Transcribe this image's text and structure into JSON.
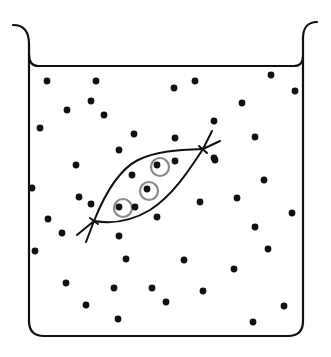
{
  "diagram": {
    "title": "Dialysis bag in beaker (diffusion / osmosis)",
    "colors": {
      "outline": "#111111",
      "particle": "#111111",
      "large_molecule_ring": "#8a8a8a",
      "background": "#ffffff"
    },
    "beaker": {
      "left_wall_x": 29,
      "right_wall_x": 303,
      "bottom_y": 336,
      "water_line_y": 66,
      "corner_radius": 15
    },
    "bag": {
      "knot_bottom_left": [
        94,
        221
      ],
      "knot_top_right": [
        203,
        149
      ],
      "large_molecules": [
        {
          "cx": 160,
          "cy": 167,
          "r": 9
        },
        {
          "cx": 149,
          "cy": 191,
          "r": 9
        },
        {
          "cx": 123,
          "cy": 208,
          "r": 9
        }
      ]
    },
    "particles": [
      [
        47,
        81
      ],
      [
        96,
        81
      ],
      [
        91,
        101
      ],
      [
        67,
        110
      ],
      [
        104,
        115
      ],
      [
        40,
        128
      ],
      [
        134,
        134
      ],
      [
        119,
        150
      ],
      [
        174,
        88
      ],
      [
        195,
        81
      ],
      [
        271,
        75
      ],
      [
        295,
        91
      ],
      [
        242,
        103
      ],
      [
        214,
        121
      ],
      [
        175,
        138
      ],
      [
        255,
        137
      ],
      [
        214,
        158
      ],
      [
        76,
        165
      ],
      [
        32,
        188
      ],
      [
        79,
        197
      ],
      [
        91,
        204
      ],
      [
        48,
        219
      ],
      [
        62,
        233
      ],
      [
        119,
        236
      ],
      [
        157,
        217
      ],
      [
        132,
        175
      ],
      [
        135,
        207
      ],
      [
        157,
        165
      ],
      [
        147,
        189
      ],
      [
        119,
        207
      ],
      [
        175,
        161
      ],
      [
        215,
        160
      ],
      [
        264,
        180
      ],
      [
        237,
        198
      ],
      [
        200,
        202
      ],
      [
        292,
        213
      ],
      [
        255,
        227
      ],
      [
        268,
        249
      ],
      [
        35,
        251
      ],
      [
        126,
        259
      ],
      [
        66,
        283
      ],
      [
        114,
        288
      ],
      [
        152,
        288
      ],
      [
        86,
        305
      ],
      [
        118,
        319
      ],
      [
        166,
        302
      ],
      [
        184,
        260
      ],
      [
        234,
        269
      ],
      [
        203,
        291
      ],
      [
        284,
        306
      ],
      [
        253,
        322
      ]
    ]
  }
}
